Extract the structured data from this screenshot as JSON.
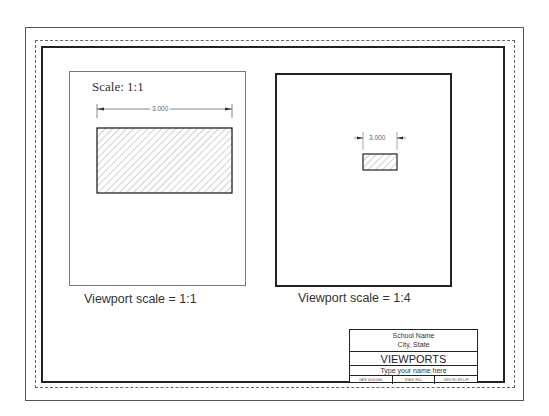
{
  "sheet": {
    "border_color": "#222222",
    "dashed_color": "#666666"
  },
  "viewports": [
    {
      "label": "Scale: 1:1",
      "dimension": "3.000",
      "caption": "Viewport scale = 1:1"
    },
    {
      "dimension": "3.000",
      "caption": "Viewport scale = 1:4"
    }
  ],
  "title_block": {
    "school_name": "School Name",
    "city_state": "City, State",
    "title": "VIEWPORTS",
    "name_placeholder": "Type your name here",
    "info": [
      "DATE: 00-00-0000",
      "SCALE: FULL",
      "DWG. NO. EX-0-0P"
    ]
  }
}
